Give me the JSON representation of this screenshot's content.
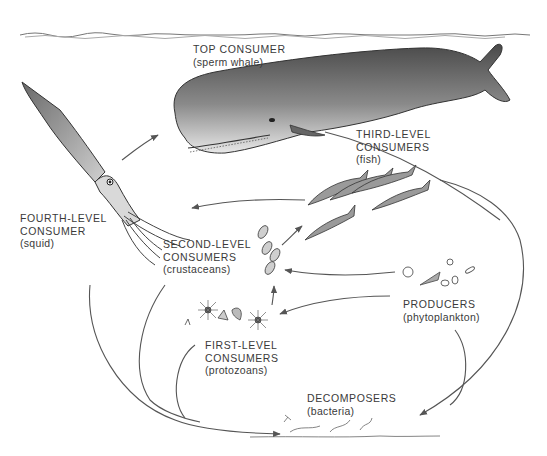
{
  "diagram": {
    "type": "marine food web",
    "colors": {
      "ink": "#3a3a3a",
      "line": "#555555",
      "background": "#ffffff"
    },
    "nodes": [
      {
        "id": "top",
        "title_lines": [
          "TOP CONSUMER"
        ],
        "subtitle": "(sperm whale)"
      },
      {
        "id": "fourth",
        "title_lines": [
          "FOURTH-LEVEL",
          "CONSUMER"
        ],
        "subtitle": "(squid)"
      },
      {
        "id": "third",
        "title_lines": [
          "THIRD-LEVEL",
          "CONSUMERS"
        ],
        "subtitle": "(fish)"
      },
      {
        "id": "second",
        "title_lines": [
          "SECOND-LEVEL",
          "CONSUMERS"
        ],
        "subtitle": "(crustaceans)"
      },
      {
        "id": "producers",
        "title_lines": [
          "PRODUCERS"
        ],
        "subtitle": "(phytoplankton)"
      },
      {
        "id": "first",
        "title_lines": [
          "FIRST-LEVEL",
          "CONSUMERS"
        ],
        "subtitle": "(protozoans)"
      },
      {
        "id": "decomposers",
        "title_lines": [
          "DECOMPOSERS"
        ],
        "subtitle": "(bacteria)"
      }
    ],
    "edges": [
      {
        "from": "fourth",
        "to": "top"
      },
      {
        "from": "third",
        "to": "fourth"
      },
      {
        "from": "second",
        "to": "third"
      },
      {
        "from": "producers",
        "to": "second"
      },
      {
        "from": "producers",
        "to": "first"
      },
      {
        "from": "first",
        "to": "second"
      },
      {
        "from": "top",
        "to": "decomposers"
      },
      {
        "from": "fourth",
        "to": "decomposers"
      },
      {
        "from": "second",
        "to": "decomposers"
      },
      {
        "from": "first",
        "to": "decomposers"
      },
      {
        "from": "producers",
        "to": "decomposers"
      },
      {
        "from": "third",
        "to": "decomposers"
      }
    ]
  }
}
